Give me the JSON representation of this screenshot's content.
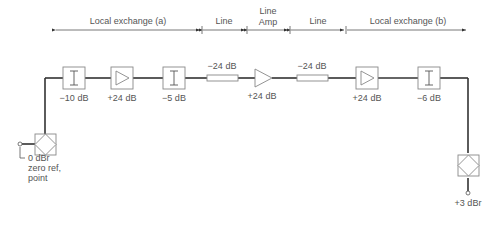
{
  "sections": [
    {
      "label": "Local exchange (a)",
      "x_start": 55,
      "x_end": 202
    },
    {
      "label": "Line",
      "x_start": 202,
      "x_end": 247
    },
    {
      "label": "Line\nAmp",
      "line1": "Line",
      "line2": "Amp",
      "x_start": 247,
      "x_end": 290
    },
    {
      "label": "Line",
      "x_start": 290,
      "x_end": 346
    },
    {
      "label": "Local exchange (b)",
      "x_start": 346,
      "x_end": 467
    }
  ],
  "components": [
    {
      "type": "hybrid",
      "label": "",
      "x": 45
    },
    {
      "type": "attenuator",
      "label": "−10 dB"
    },
    {
      "type": "amplifier",
      "label": "+24 dB"
    },
    {
      "type": "attenuator",
      "label": "−5 dB"
    },
    {
      "type": "line",
      "label": "−24 dB"
    },
    {
      "type": "line-amplifier",
      "label": "+24 dB"
    },
    {
      "type": "line",
      "label": "−24 dB"
    },
    {
      "type": "amplifier",
      "label": "+24 dB"
    },
    {
      "type": "attenuator",
      "label": "−6 dB"
    },
    {
      "type": "hybrid",
      "label": ""
    }
  ],
  "endpoints": {
    "left": {
      "line1": "0 dBr",
      "line2": "zero ref,",
      "line3": "point"
    },
    "right": {
      "label": "+3 dBr"
    }
  },
  "colors": {
    "line": "#333333",
    "box": "#888888",
    "text": "#555555"
  }
}
